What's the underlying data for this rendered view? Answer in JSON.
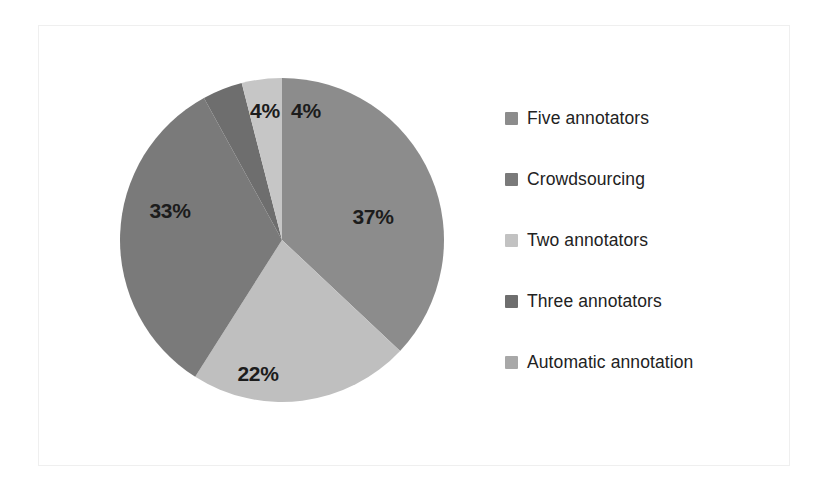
{
  "chart_data": {
    "type": "pie",
    "title": "",
    "subtitle": "",
    "xlabel": "",
    "ylabel": "",
    "legend_position": "right",
    "grid": false,
    "value_unit": "%",
    "labels_shown_on_slices": true,
    "categories": [
      "Five annotators",
      "Crowdsourcing",
      "Two annotators",
      "Three annotators",
      "Automatic annotation"
    ],
    "values": [
      37,
      33,
      22,
      4,
      4
    ],
    "slice_label_texts": [
      "37%",
      "33%",
      "22%",
      "4%",
      "4%"
    ],
    "colors": [
      "#8c8c8c",
      "#7a7a7a",
      "#bfbfbf",
      "#6e6e6e",
      "#c6c6c6"
    ],
    "slices": [
      {
        "name": "Five annotators",
        "value": 37,
        "label": "37%",
        "color": "#8c8c8c",
        "start_angle": 0,
        "end_angle": 133.2,
        "label_x": 263,
        "label_y": 158
      },
      {
        "name": "Two annotators",
        "value": 22,
        "label": "22%",
        "color": "#bfbfbf",
        "start_angle": 133.2,
        "end_angle": 212.4,
        "label_x": 148,
        "label_y": 315
      },
      {
        "name": "Crowdsourcing",
        "value": 33,
        "label": "33%",
        "color": "#7a7a7a",
        "start_angle": 212.4,
        "end_angle": 331.2,
        "label_x": 60,
        "label_y": 152
      },
      {
        "name": "Three annotators",
        "value": 4,
        "label": "4%",
        "color": "#6e6e6e",
        "start_angle": 331.2,
        "end_angle": 345.6,
        "label_x": 155,
        "label_y": 52
      },
      {
        "name": "Automatic annotation",
        "value": 4,
        "label": "4%",
        "color": "#c6c6c6",
        "start_angle": 345.6,
        "end_angle": 360,
        "label_x": 196,
        "label_y": 52
      }
    ],
    "geometry": {
      "center_x": 172,
      "center_y": 180,
      "radius": 162
    }
  },
  "legend": {
    "items": [
      {
        "label": "Five annotators",
        "swatch_color": "#8c8c8c"
      },
      {
        "label": "Crowdsourcing",
        "swatch_color": "#7a7a7a"
      },
      {
        "label": "Two annotators",
        "swatch_color": "#c2c2c2"
      },
      {
        "label": "Three annotators",
        "swatch_color": "#6e6e6e"
      },
      {
        "label": "Automatic annotation",
        "swatch_color": "#a8a8a8"
      }
    ]
  }
}
